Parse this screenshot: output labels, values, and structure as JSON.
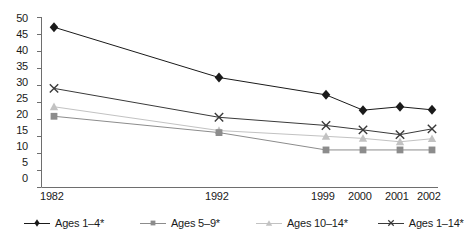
{
  "chart_data": {
    "type": "line",
    "title": "",
    "xlabel": "",
    "ylabel": "",
    "grid": false,
    "legend_position": "bottom",
    "categories": [
      "1982",
      "1992",
      "1999",
      "2000",
      "2001",
      "2002"
    ],
    "x_tick_labels": [
      "1982",
      "1992",
      "1999",
      "2000",
      "2001",
      "2002"
    ],
    "y_tick_labels": [
      "0",
      "5",
      "10",
      "15",
      "20",
      "25",
      "30",
      "35",
      "40",
      "45",
      "50"
    ],
    "y_ticks": [
      0,
      5,
      10,
      15,
      20,
      25,
      30,
      35,
      40,
      45,
      50
    ],
    "ylim": [
      0,
      50
    ],
    "series": [
      {
        "name": "Ages 1–4*",
        "marker": "diamond",
        "color": "#1a1a1a",
        "values": [
          47.0,
          32.2,
          27.1,
          22.6,
          23.6,
          22.7
        ]
      },
      {
        "name": "Ages 5–9*",
        "marker": "square",
        "color": "#8c8c8c",
        "values": [
          20.8,
          16.0,
          10.9,
          10.9,
          10.9,
          10.9
        ]
      },
      {
        "name": "Ages 10–14*",
        "marker": "triangle",
        "color": "#c2c2c2",
        "values": [
          23.6,
          16.6,
          14.9,
          14.3,
          13.3,
          14.2
        ]
      },
      {
        "name": "Ages 1–14*",
        "marker": "cross",
        "color": "#3a3a3a",
        "values": [
          29.0,
          20.5,
          18.1,
          16.8,
          15.4,
          17.1
        ]
      }
    ]
  },
  "legend": {
    "items": [
      {
        "label": "Ages 1–4*"
      },
      {
        "label": "Ages 5–9*"
      },
      {
        "label": "Ages 10–14*"
      },
      {
        "label": "Ages 1–14*"
      }
    ]
  },
  "axis": {
    "y_labels": [
      "50",
      "45",
      "40",
      "35",
      "30",
      "25",
      "20",
      "15",
      "10",
      "5",
      "0"
    ],
    "x_labels": [
      "1982",
      "1992",
      "1999",
      "2000",
      "2001",
      "2002"
    ]
  },
  "colors": {
    "ages_1_4": "#1a1a1a",
    "ages_5_9": "#8c8c8c",
    "ages_10_14": "#c2c2c2",
    "ages_1_14": "#3a3a3a",
    "axis": "#6e6e6e",
    "text": "#1a1a1a",
    "background": "#ffffff"
  }
}
